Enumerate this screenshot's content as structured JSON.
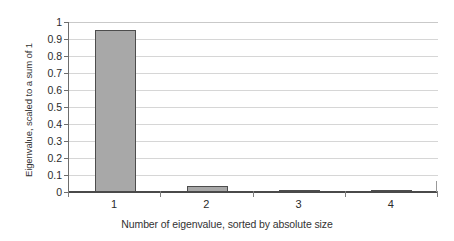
{
  "chart_data": {
    "type": "bar",
    "title": "",
    "xlabel": "Number of eigenvalue, sorted by absolute size",
    "ylabel": "Eigenvalue, scaled to a sum of 1",
    "categories": [
      "1",
      "2",
      "3",
      "4"
    ],
    "values": [
      0.952,
      0.038,
      0.006,
      0.004
    ],
    "ylim": [
      0,
      1
    ],
    "yticks": [
      0,
      0.1,
      0.2,
      0.3,
      0.4,
      0.5,
      0.6,
      0.7,
      0.8,
      0.9,
      1
    ],
    "ytick_labels": [
      "0",
      "0.1",
      "0.2",
      "0.3",
      "0.4",
      "0.5",
      "0.6",
      "0.7",
      "0.8",
      "0.9",
      "1"
    ],
    "grid": true,
    "grid_axis": "y",
    "legend": false,
    "series": [
      {
        "name": "Eigenvalue",
        "values": [
          0.952,
          0.038,
          0.006,
          0.004
        ]
      }
    ],
    "colors": {
      "bar_fill": "#a8a8a8",
      "bar_edge": "#4d4d4d",
      "gridline": "#d6d6d6",
      "axis": "#4a4a4a",
      "background": "#ffffff",
      "text": "#2b2b2b"
    }
  }
}
